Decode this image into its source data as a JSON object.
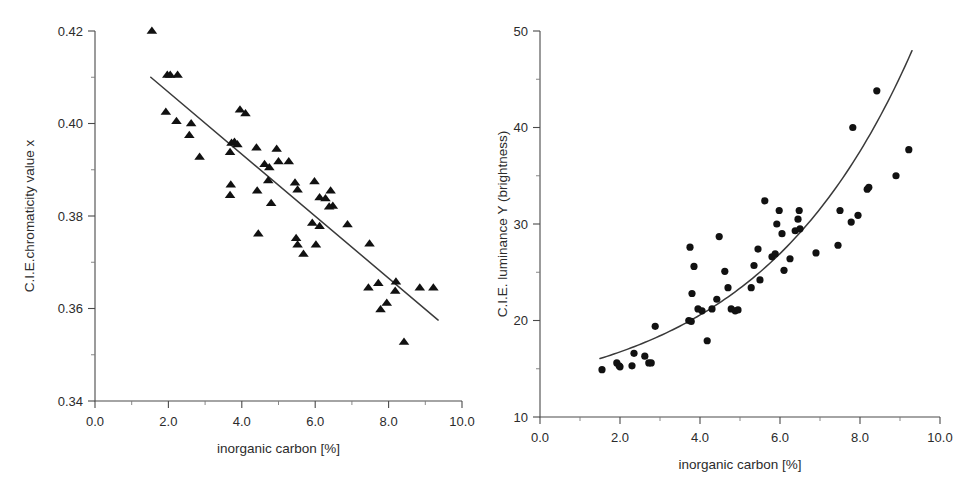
{
  "figure": {
    "background": "#ffffff",
    "marker_color": "#111111",
    "line_color": "#3a3a3a",
    "axis_color": "#4a4a4a",
    "panel_count": 2
  },
  "chart_data": [
    {
      "type": "scatter",
      "panel": "left",
      "title": "",
      "xlabel": "inorganic carbon [%]",
      "ylabel": "C.I.E.chromaticity value x",
      "xlim": [
        0.0,
        10.0
      ],
      "ylim": [
        0.34,
        0.42
      ],
      "xticks": [
        0.0,
        2.0,
        4.0,
        6.0,
        8.0,
        10.0
      ],
      "xticklabels": [
        "0.0",
        "2.0",
        "4.0",
        "6.0",
        "8.0",
        "10.0"
      ],
      "yticks": [
        0.34,
        0.36,
        0.38,
        0.4,
        0.42
      ],
      "yticklabels": [
        "0.34",
        "0.36",
        "0.38",
        "0.40",
        "0.42"
      ],
      "xminor": [
        1.0,
        3.0,
        5.0,
        7.0,
        9.0
      ],
      "yminor": [
        0.35,
        0.37,
        0.39,
        0.41
      ],
      "grid": false,
      "legend": "none",
      "marker": "triangle",
      "marker_size": 4.6,
      "series": [
        {
          "name": "C.I.E. chromaticity x vs inorganic carbon",
          "marker": "triangle",
          "points": [
            [
              1.55,
              0.42
            ],
            [
              1.97,
              0.4105
            ],
            [
              2.05,
              0.4105
            ],
            [
              2.25,
              0.4105
            ],
            [
              1.93,
              0.4025
            ],
            [
              2.22,
              0.4005
            ],
            [
              2.62,
              0.4
            ],
            [
              2.57,
              0.3975
            ],
            [
              2.85,
              0.3928
            ],
            [
              3.72,
              0.3958
            ],
            [
              3.8,
              0.396
            ],
            [
              3.88,
              0.3955
            ],
            [
              3.95,
              0.403
            ],
            [
              4.1,
              0.4022
            ],
            [
              3.68,
              0.3938
            ],
            [
              4.4,
              0.3948
            ],
            [
              4.95,
              0.3945
            ],
            [
              4.62,
              0.3912
            ],
            [
              4.75,
              0.3905
            ],
            [
              5.0,
              0.3918
            ],
            [
              5.28,
              0.3918
            ],
            [
              3.7,
              0.3868
            ],
            [
              3.68,
              0.3845
            ],
            [
              4.42,
              0.3855
            ],
            [
              4.72,
              0.3877
            ],
            [
              5.45,
              0.3872
            ],
            [
              5.98,
              0.3875
            ],
            [
              5.52,
              0.3857
            ],
            [
              6.12,
              0.384
            ],
            [
              6.28,
              0.3838
            ],
            [
              6.42,
              0.3855
            ],
            [
              6.48,
              0.3822
            ],
            [
              6.38,
              0.382
            ],
            [
              4.8,
              0.3828
            ],
            [
              4.45,
              0.3762
            ],
            [
              5.92,
              0.3785
            ],
            [
              6.12,
              0.3778
            ],
            [
              5.48,
              0.3752
            ],
            [
              5.52,
              0.3738
            ],
            [
              6.02,
              0.3738
            ],
            [
              5.68,
              0.3718
            ],
            [
              6.88,
              0.3782
            ],
            [
              7.48,
              0.374
            ],
            [
              7.45,
              0.3645
            ],
            [
              7.72,
              0.3655
            ],
            [
              8.2,
              0.3658
            ],
            [
              8.18,
              0.3638
            ],
            [
              8.85,
              0.3645
            ],
            [
              9.22,
              0.3645
            ],
            [
              7.78,
              0.3598
            ],
            [
              7.95,
              0.3612
            ],
            [
              8.42,
              0.3528
            ]
          ]
        }
      ],
      "fit": {
        "kind": "linear",
        "x_start": 1.52,
        "x_end": 9.35,
        "y_start": 0.41,
        "y_end": 0.3575
      }
    },
    {
      "type": "scatter",
      "panel": "right",
      "title": "",
      "xlabel": "inorganic carbon [%]",
      "ylabel": "C.I.E. luminance Y (brightness)",
      "xlim": [
        0.0,
        10.0
      ],
      "ylim": [
        10,
        50
      ],
      "xticks": [
        0.0,
        2.0,
        4.0,
        6.0,
        8.0,
        10.0
      ],
      "xticklabels": [
        "0.0",
        "2.0",
        "4.0",
        "6.0",
        "8.0",
        "10.0"
      ],
      "yticks": [
        10,
        20,
        30,
        40,
        50
      ],
      "yticklabels": [
        "10",
        "20",
        "30",
        "40",
        "50"
      ],
      "xminor": [
        1.0,
        3.0,
        5.0,
        7.0,
        9.0
      ],
      "yminor": [
        15,
        25,
        35,
        45
      ],
      "grid": false,
      "legend": "none",
      "marker": "circle",
      "marker_size": 3.6,
      "series": [
        {
          "name": "C.I.E. luminance Y vs inorganic carbon",
          "marker": "circle",
          "points": [
            [
              1.55,
              14.9
            ],
            [
              1.92,
              15.6
            ],
            [
              1.98,
              15.3
            ],
            [
              2.0,
              15.2
            ],
            [
              2.3,
              15.3
            ],
            [
              2.35,
              16.6
            ],
            [
              2.62,
              16.3
            ],
            [
              2.72,
              15.6
            ],
            [
              2.78,
              15.6
            ],
            [
              2.88,
              19.4
            ],
            [
              3.72,
              20.0
            ],
            [
              3.78,
              19.9
            ],
            [
              3.8,
              22.8
            ],
            [
              3.85,
              25.6
            ],
            [
              3.75,
              27.6
            ],
            [
              3.95,
              21.2
            ],
            [
              4.05,
              21.0
            ],
            [
              4.18,
              17.9
            ],
            [
              4.3,
              21.2
            ],
            [
              4.42,
              22.2
            ],
            [
              4.48,
              28.7
            ],
            [
              4.62,
              25.1
            ],
            [
              4.7,
              23.4
            ],
            [
              4.78,
              21.2
            ],
            [
              4.88,
              21.0
            ],
            [
              4.95,
              21.1
            ],
            [
              5.28,
              23.4
            ],
            [
              5.35,
              25.7
            ],
            [
              5.45,
              27.4
            ],
            [
              5.5,
              24.2
            ],
            [
              5.62,
              32.4
            ],
            [
              5.8,
              26.6
            ],
            [
              5.88,
              26.9
            ],
            [
              5.92,
              30.0
            ],
            [
              5.98,
              31.4
            ],
            [
              6.05,
              29.0
            ],
            [
              6.1,
              25.2
            ],
            [
              6.25,
              26.4
            ],
            [
              6.38,
              29.3
            ],
            [
              6.45,
              30.5
            ],
            [
              6.48,
              31.4
            ],
            [
              6.5,
              29.5
            ],
            [
              6.9,
              27.0
            ],
            [
              7.45,
              27.8
            ],
            [
              7.5,
              31.4
            ],
            [
              7.78,
              30.2
            ],
            [
              7.82,
              40.0
            ],
            [
              7.95,
              30.9
            ],
            [
              8.18,
              33.6
            ],
            [
              8.22,
              33.8
            ],
            [
              8.42,
              43.8
            ],
            [
              8.9,
              35.0
            ],
            [
              9.22,
              37.7
            ]
          ]
        }
      ],
      "fit": {
        "kind": "curve",
        "x_start": 1.5,
        "x_end": 9.3,
        "description": "monotonic increasing convex curve from ~15.6 at x=1.5 to ~40.3 at x=9.3"
      }
    }
  ]
}
